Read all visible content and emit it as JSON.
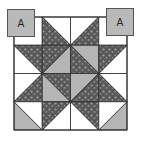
{
  "diagram": {
    "block": {
      "x": 14,
      "y": 17,
      "size": 113,
      "grid": 4
    },
    "colors": {
      "white": "#ffffff",
      "print": "#5a5a5a",
      "print_spots": "#9a9a9a",
      "grey": "#b5b5b5",
      "line": "#2a2a2a",
      "label_fill": "#b9b9b9"
    },
    "cells": [
      {
        "r": 0,
        "c": 0,
        "type": "plain",
        "fill": "white"
      },
      {
        "r": 0,
        "c": 1,
        "type": "hst",
        "diag": "tl-br",
        "a": "white",
        "b": "print",
        "a_side": "upper-right"
      },
      {
        "r": 0,
        "c": 2,
        "type": "hst",
        "diag": "tr-bl",
        "a": "white",
        "b": "print",
        "a_side": "upper-left"
      },
      {
        "r": 0,
        "c": 3,
        "type": "plain",
        "fill": "white"
      },
      {
        "r": 1,
        "c": 0,
        "type": "hst",
        "diag": "tl-br",
        "a": "white",
        "b": "print",
        "a_side": "lower-left"
      },
      {
        "r": 1,
        "c": 1,
        "type": "hst",
        "diag": "bl-tr",
        "a": "grey",
        "b": "print",
        "a_side": "lower-right"
      },
      {
        "r": 1,
        "c": 2,
        "type": "hst",
        "diag": "tl-br",
        "a": "grey",
        "b": "print",
        "a_side": "upper-right"
      },
      {
        "r": 1,
        "c": 3,
        "type": "hst",
        "diag": "tr-bl",
        "a": "white",
        "b": "print",
        "a_side": "lower-right"
      },
      {
        "r": 2,
        "c": 0,
        "type": "hst",
        "diag": "bl-tr",
        "a": "white",
        "b": "print",
        "a_side": "upper-left"
      },
      {
        "r": 2,
        "c": 1,
        "type": "hst",
        "diag": "tl-br",
        "a": "grey",
        "b": "print",
        "a_side": "lower-left"
      },
      {
        "r": 2,
        "c": 2,
        "type": "hst",
        "diag": "bl-tr",
        "a": "grey",
        "b": "print",
        "a_side": "upper-left"
      },
      {
        "r": 2,
        "c": 3,
        "type": "hst",
        "diag": "tl-br",
        "a": "white",
        "b": "print",
        "a_side": "upper-right"
      },
      {
        "r": 3,
        "c": 0,
        "type": "hst3",
        "diag": "tl-br",
        "a": "grey",
        "b": "white",
        "a_side": "lower-left"
      },
      {
        "r": 3,
        "c": 1,
        "type": "hst",
        "diag": "bl-tr",
        "a": "white",
        "b": "print",
        "a_side": "lower-right"
      },
      {
        "r": 3,
        "c": 2,
        "type": "hst",
        "diag": "tl-br",
        "a": "white",
        "b": "print",
        "a_side": "lower-left"
      },
      {
        "r": 3,
        "c": 3,
        "type": "hst3",
        "diag": "tr-bl",
        "a": "grey",
        "b": "white",
        "a_side": "lower-right"
      }
    ],
    "labels": [
      {
        "text": "A",
        "x": 7,
        "y": 9
      },
      {
        "text": "A",
        "x": 106,
        "y": 8
      }
    ]
  }
}
